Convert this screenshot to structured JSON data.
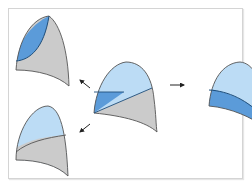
{
  "diagram": {
    "colors": {
      "light_blue": "#bcdcf5",
      "blue": "#5b9bd9",
      "gray": "#cbcbcb",
      "outline": "#555555",
      "dark_outline": "#1f4e7a",
      "arrow": "#222222",
      "frame_border": "#d4d4d4"
    },
    "shapes": [
      {
        "id": "center",
        "position": "center",
        "regions": [
          "light-blue-top",
          "blue-left-wedge",
          "gray-bottom-right"
        ]
      },
      {
        "id": "top-left",
        "position": "upper-left",
        "regions": [
          "blue-left-lens",
          "gray-remainder"
        ]
      },
      {
        "id": "right",
        "position": "right",
        "regions": [
          "light-blue-top",
          "blue-bottom-band"
        ]
      },
      {
        "id": "bottom-left",
        "position": "lower-left",
        "regions": [
          "light-blue-top",
          "gray-bottom"
        ]
      }
    ],
    "arrows": [
      {
        "from": "center",
        "to": "top-left",
        "direction": "up-left"
      },
      {
        "from": "center",
        "to": "right",
        "direction": "right"
      },
      {
        "from": "center",
        "to": "bottom-left",
        "direction": "down-left"
      }
    ]
  }
}
